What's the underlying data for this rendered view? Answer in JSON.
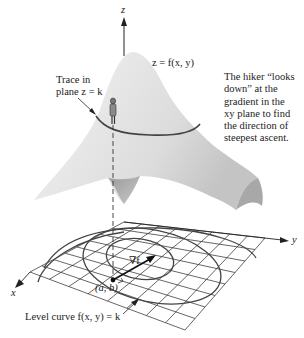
{
  "figure": {
    "axes": {
      "z_label": "z",
      "y_label": "y",
      "x_label": "x"
    },
    "surface_label": "z = f(x, y)",
    "trace_label": {
      "line1": "Trace in",
      "line2": "plane z = k"
    },
    "gradient_label": "∇f",
    "point_label": "(a, b)",
    "level_curve_label": "Level curve f(x, y) = k",
    "hiker_note": {
      "lines": [
        "The hiker “looks",
        "down” at the",
        "gradient in the",
        "xy plane to find",
        "the direction of",
        "steepest ascent."
      ]
    },
    "colors": {
      "surface_light": "#e6e6e6",
      "surface_dark": "#a9a9a9",
      "ink": "#222222",
      "grid": "#333333"
    }
  }
}
